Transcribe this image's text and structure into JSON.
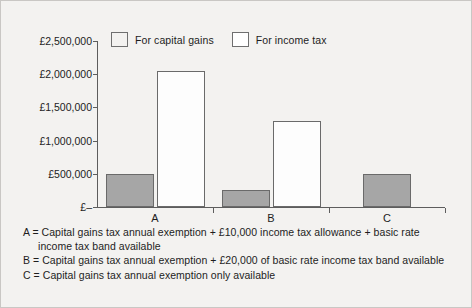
{
  "chart_data": {
    "type": "bar",
    "title": "",
    "xlabel": "",
    "ylabel": "",
    "categories": [
      "A",
      "B",
      "C"
    ],
    "series": [
      {
        "name": "For capital gains",
        "color": "#a6a6a6",
        "values": [
          500000,
          250000,
          500000
        ]
      },
      {
        "name": "For income tax",
        "color": "#ffffff",
        "values": [
          2050000,
          1300000,
          null
        ]
      }
    ],
    "ylim": [
      0,
      2500000
    ],
    "ytick_values": [
      2500000,
      2000000,
      1500000,
      1000000,
      500000,
      0
    ],
    "ytick_labels": [
      "£2,500,000",
      "£2,000,000",
      "£1,500,000",
      "£1,000,000",
      "£500,000",
      "£–"
    ],
    "grid": false,
    "legend_position": "top-left-inside"
  },
  "legend": {
    "entries": [
      {
        "label": "For capital gains",
        "swatch": "#a6a6a6"
      },
      {
        "label": "For income tax",
        "swatch": "#ffffff"
      }
    ]
  },
  "footnotes": [
    "A = Capital gains tax annual exemption + £10,000 income tax allowance + basic rate income tax band available",
    "B = Capital gains tax annual exemption + £20,000 of basic rate income tax band available",
    "C = Capital gains tax annual exemption only available"
  ],
  "colors": {
    "background": "#f3f2f0",
    "frame": "#c9c7c4",
    "axis": "#5d5d5d",
    "bar_border": "#6a6a6a",
    "capital_gains_fill": "#a6a6a6",
    "income_tax_fill": "#fdfdfd",
    "text": "#1d1d1d"
  }
}
